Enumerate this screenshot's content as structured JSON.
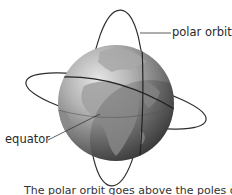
{
  "diagram": {
    "labels": {
      "polar_orbit": "polar orbit",
      "equator": "equator"
    },
    "caption": "The polar orbit goes above the poles of the E"
  },
  "colors": {
    "background": "#ffffff",
    "orbit_line": "#2e2e2e",
    "globe_ocean_light": "#cfcfcf",
    "globe_ocean_dark": "#3a3a3a",
    "globe_land": "#9a9a9a",
    "label_text": "#2a2a2a"
  }
}
